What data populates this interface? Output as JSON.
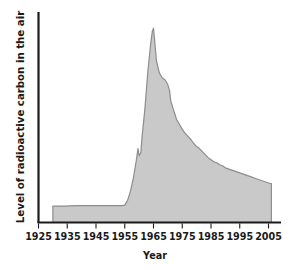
{
  "chart_data": {
    "type": "area",
    "title": "",
    "xlabel": "Year",
    "ylabel": "Level of radioactive carbon in the air",
    "grid": false,
    "legend": "none",
    "xlim": [
      1925,
      2008
    ],
    "ylim": [
      0,
      100
    ],
    "xticks": [
      1925,
      1935,
      1945,
      1955,
      1965,
      1975,
      1985,
      1995,
      2005
    ],
    "xtick_labels": [
      "1925",
      "1935",
      "1945",
      "1955",
      "1965",
      "1975",
      "1985",
      "1995",
      "2005"
    ],
    "yticks": [],
    "ytick_labels": [],
    "series": [
      {
        "name": "Level of radioactive carbon in the air",
        "fill_color": "#c9c9c9",
        "line_color": "#8d8d8d",
        "x": [
          1930,
          1934,
          1938,
          1942,
          1946,
          1950,
          1954,
          1955,
          1956,
          1957,
          1958,
          1959,
          1959.6,
          1960,
          1960.6,
          1961,
          1962,
          1963,
          1964,
          1964.6,
          1965,
          1965.4,
          1966,
          1967,
          1968,
          1969,
          1970,
          1970.6,
          1971,
          1972,
          1973,
          1974,
          1975,
          1976,
          1977,
          1978,
          1979,
          1980,
          1981,
          1982,
          1983,
          1984,
          1985,
          1986,
          1987,
          1988,
          1989,
          1990,
          1991,
          1992,
          1993,
          1994,
          1995,
          1996,
          1997,
          1998,
          1999,
          2000,
          2001,
          2002,
          2003,
          2004,
          2005,
          2006
        ],
        "y": [
          8.1,
          8.1,
          8.3,
          8.3,
          8.3,
          8.3,
          8.3,
          8.6,
          11.0,
          15.5,
          22.0,
          30.5,
          36.5,
          33.0,
          34.5,
          42.0,
          56.0,
          74.0,
          88.0,
          94.5,
          96.0,
          90.0,
          80.0,
          74.0,
          71.5,
          70.5,
          68.0,
          65.0,
          60.0,
          55.5,
          51.0,
          48.5,
          46.0,
          44.0,
          42.5,
          41.0,
          39.0,
          37.5,
          36.5,
          35.0,
          33.5,
          32.0,
          31.0,
          30.0,
          29.5,
          28.5,
          28.0,
          27.0,
          26.5,
          26.0,
          25.5,
          25.0,
          24.5,
          24.0,
          23.5,
          23.0,
          22.5,
          22.0,
          21.5,
          21.0,
          20.5,
          20.0,
          19.5,
          19.2
        ]
      }
    ],
    "annotations": [
      {
        "label": "sharp rise begins",
        "x": 1955
      },
      {
        "label": "peak",
        "x": 1965
      },
      {
        "label": "exponential decline",
        "x": 1975
      }
    ]
  },
  "axes": {
    "x_title": "Year",
    "y_title": "Level of radioactive carbon in the air"
  }
}
